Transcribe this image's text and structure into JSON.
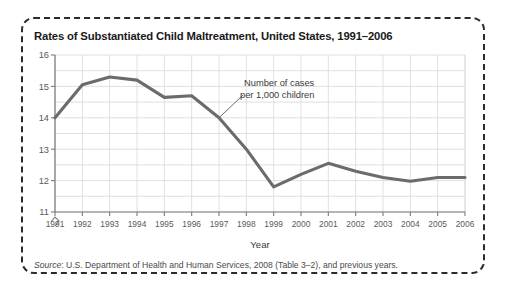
{
  "figure": {
    "title": "Rates of Substantiated Child Maltreatment, United States, 1991–2006",
    "source_label": "Source",
    "source_text": ": U.S. Department of Health and Human Services, 2008 (Table 3–2), and previous years.",
    "border_color": "#2b2b2b",
    "background": "#ffffff"
  },
  "chart_data": {
    "type": "line",
    "title": "Rates of Substantiated Child Maltreatment, United States, 1991–2006",
    "xlabel": "Year",
    "ylabel": "",
    "categories": [
      "1991",
      "1992",
      "1993",
      "1994",
      "1995",
      "1996",
      "1997",
      "1998",
      "1999",
      "2000",
      "2001",
      "2002",
      "2003",
      "2004",
      "2005",
      "2006"
    ],
    "x": [
      1991,
      1992,
      1993,
      1994,
      1995,
      1996,
      1997,
      1998,
      1999,
      2000,
      2001,
      2002,
      2003,
      2004,
      2005,
      2006
    ],
    "values": [
      14.0,
      15.05,
      15.3,
      15.2,
      14.65,
      14.7,
      14.0,
      13.0,
      11.8,
      12.2,
      12.55,
      12.3,
      12.1,
      11.98,
      12.1,
      12.1
    ],
    "series": [
      {
        "name": "Number of cases per 1,000 children",
        "values": [
          14.0,
          15.05,
          15.3,
          15.2,
          14.65,
          14.7,
          14.0,
          13.0,
          11.8,
          12.2,
          12.55,
          12.3,
          12.1,
          11.98,
          12.1,
          12.1
        ],
        "color": "#6b6b6b"
      }
    ],
    "ylim": [
      11,
      16
    ],
    "yticks": [
      11,
      12,
      13,
      14,
      15,
      16
    ],
    "ytick_labels": [
      "11",
      "12",
      "13",
      "14",
      "15",
      "16"
    ],
    "y_minor_step": 0.5,
    "grid": true,
    "grid_color": "#d8d8d8",
    "legend": "none",
    "y_axis_break": true,
    "annotations": [
      {
        "name": "series-callout",
        "line1": "Number of cases",
        "line2": "per 1,000 children",
        "points_to_year": 1997,
        "points_to_value": 14.0
      }
    ]
  },
  "axes": {
    "x_title": "Year"
  }
}
